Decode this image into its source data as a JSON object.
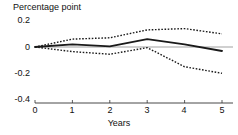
{
  "chart_data": {
    "type": "line",
    "title": "",
    "ylabel": "Percentage point",
    "xlabel": "Years",
    "x": [
      0,
      1,
      2,
      3,
      4,
      5
    ],
    "xlim": [
      0,
      5
    ],
    "ylim": [
      -0.4,
      0.2
    ],
    "yticks": [
      0.2,
      0,
      -0.2,
      -0.4
    ],
    "ytick_labels": [
      "0.2",
      "0",
      "-0.2",
      "-0.4"
    ],
    "xticks": [
      0,
      1,
      2,
      3,
      4,
      5
    ],
    "xtick_labels": [
      "0",
      "1",
      "2",
      "3",
      "4",
      "5"
    ],
    "grid": false,
    "legend": "none",
    "zero_reference_line": true,
    "series": [
      {
        "name": "Point estimate",
        "style": "solid",
        "color": "#1a1a1a",
        "values": [
          0,
          0.02,
          0.005,
          0.06,
          0.02,
          -0.03
        ]
      },
      {
        "name": "Upper confidence bound",
        "style": "dotted",
        "color": "#1a1a1a",
        "values": [
          0,
          0.06,
          0.07,
          0.13,
          0.14,
          0.1
        ]
      },
      {
        "name": "Lower confidence bound",
        "style": "dotted",
        "color": "#1a1a1a",
        "values": [
          0,
          -0.035,
          -0.055,
          -0.005,
          -0.15,
          -0.2
        ]
      }
    ]
  },
  "axis": {
    "y_title": "Percentage point",
    "x_title": "Years",
    "ytick_0": "0.2",
    "ytick_1": "0",
    "ytick_2": "-0.2",
    "ytick_3": "-0.4",
    "xtick_0": "0",
    "xtick_1": "1",
    "xtick_2": "2",
    "xtick_3": "3",
    "xtick_4": "4",
    "xtick_5": "5"
  },
  "colors": {
    "line": "#1a1a1a",
    "zero_reference": "#d0d0d0",
    "axis": "#333333",
    "background": "#ffffff"
  }
}
